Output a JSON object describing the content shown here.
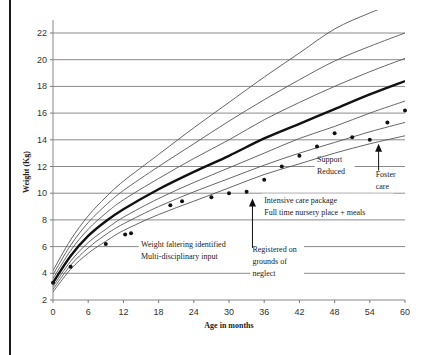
{
  "chart_data": {
    "type": "line",
    "title": "",
    "xlabel": "Age in months",
    "ylabel": "Weight (Kg)",
    "xlim": [
      0,
      60
    ],
    "ylim": [
      2,
      23
    ],
    "grid": "horizontal",
    "x_ticks": [
      0,
      6,
      12,
      18,
      24,
      30,
      36,
      42,
      48,
      54,
      60
    ],
    "y_ticks": [
      2,
      4,
      6,
      8,
      10,
      12,
      14,
      16,
      18,
      20,
      22
    ],
    "centile_x": [
      0,
      3,
      6,
      9,
      12,
      18,
      24,
      30,
      36,
      42,
      48,
      54,
      60
    ],
    "centile_curves": [
      {
        "name": "centile-1",
        "values": [
          2.6,
          4.3,
          5.5,
          6.4,
          7.2,
          8.4,
          9.4,
          10.4,
          11.4,
          12.2,
          13.0,
          13.7,
          14.3
        ],
        "bold": false
      },
      {
        "name": "centile-2",
        "values": [
          2.8,
          4.6,
          5.9,
          6.9,
          7.7,
          9.0,
          10.1,
          11.1,
          12.1,
          13.0,
          13.8,
          14.6,
          15.3
        ],
        "bold": false
      },
      {
        "name": "centile-3",
        "values": [
          3.0,
          4.9,
          6.3,
          7.3,
          8.2,
          9.6,
          10.8,
          11.9,
          13.0,
          14.1,
          15.0,
          16.0,
          16.9
        ],
        "bold": false
      },
      {
        "name": "centile-median",
        "values": [
          3.3,
          5.3,
          6.8,
          7.9,
          8.8,
          10.3,
          11.6,
          12.8,
          14.1,
          15.2,
          16.3,
          17.4,
          18.4
        ],
        "bold": true
      },
      {
        "name": "centile-5",
        "values": [
          3.6,
          5.7,
          7.3,
          8.5,
          9.5,
          11.1,
          12.6,
          14.0,
          15.5,
          16.8,
          18.0,
          19.1,
          20.1
        ],
        "bold": false
      },
      {
        "name": "centile-6",
        "values": [
          3.9,
          6.1,
          7.8,
          9.1,
          10.2,
          12.0,
          13.7,
          15.4,
          17.0,
          18.5,
          19.9,
          21.0,
          22.0
        ],
        "bold": false
      },
      {
        "name": "centile-7",
        "values": [
          4.2,
          6.5,
          8.3,
          9.7,
          10.9,
          12.9,
          14.9,
          16.8,
          18.7,
          20.5,
          22.3,
          23.5,
          24.5
        ],
        "bold": false
      }
    ],
    "series": [
      {
        "name": "Child weight",
        "type": "scatter",
        "x": [
          0,
          3,
          9,
          12.3,
          13.3,
          20,
          22,
          27,
          30,
          33,
          36,
          39,
          42,
          45,
          48,
          51,
          54,
          57,
          60
        ],
        "values": [
          3.3,
          4.5,
          6.2,
          6.9,
          7.0,
          9.1,
          9.4,
          9.7,
          10.0,
          10.1,
          11.0,
          12.0,
          12.8,
          13.5,
          14.5,
          14.2,
          14.0,
          15.3,
          16.2
        ]
      }
    ],
    "annotations": [
      {
        "text": [
          "Weight faltering identified",
          "Multi-disciplinary input"
        ],
        "x_month": 15,
        "y_kg": 6.0
      },
      {
        "text": [
          "Intensive care package",
          "Full time nursery place + meals"
        ],
        "x_month": 36,
        "y_kg": 9.3
      },
      {
        "text": [
          "Registered on",
          "grounds of",
          "neglect"
        ],
        "x_month": 34,
        "y_kg": 5.6,
        "arrow_from_kg": 5.9,
        "arrow_to_kg": 9.6,
        "arrow_x_month": 34
      },
      {
        "text": [
          "Support",
          "Reduced"
        ],
        "x_month": 45,
        "y_kg": 12.3
      },
      {
        "text": [
          "Foster",
          "care"
        ],
        "x_month": 55,
        "y_kg": 11.2,
        "arrow_from_kg": 11.7,
        "arrow_to_kg": 13.7,
        "arrow_x_month": 55.5
      }
    ]
  },
  "axis": {
    "xlabel": "Age in months",
    "ylabel": "Weight (Kg)"
  }
}
